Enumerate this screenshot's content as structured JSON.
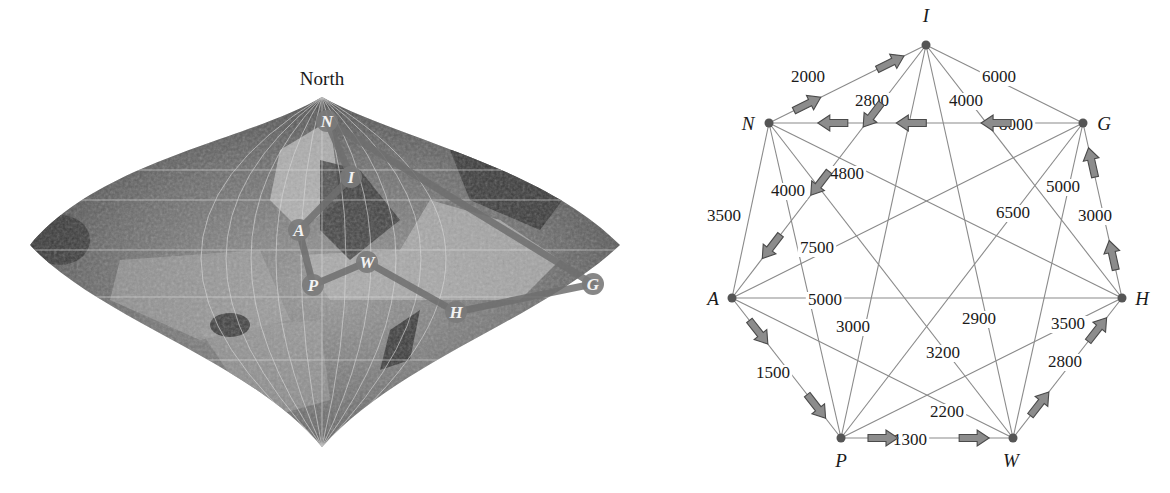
{
  "map": {
    "north_label": "North",
    "south_label": "South",
    "markers": [
      {
        "id": "N",
        "label": "N",
        "x": 327,
        "y": 121
      },
      {
        "id": "I",
        "label": "I",
        "x": 351,
        "y": 177
      },
      {
        "id": "A",
        "label": "A",
        "x": 299,
        "y": 230
      },
      {
        "id": "P",
        "label": "P",
        "x": 313,
        "y": 285
      },
      {
        "id": "W",
        "label": "W",
        "x": 367,
        "y": 262
      },
      {
        "id": "H",
        "label": "H",
        "x": 456,
        "y": 312
      },
      {
        "id": "G",
        "label": "G",
        "x": 593,
        "y": 284
      }
    ],
    "route": [
      "N",
      "I",
      "A",
      "P",
      "W",
      "H",
      "G",
      "N"
    ]
  },
  "graph": {
    "nodes": [
      {
        "id": "I",
        "label": "I",
        "x": 236,
        "y": 45,
        "lx": 236,
        "ly": 22
      },
      {
        "id": "N",
        "label": "N",
        "x": 79,
        "y": 123,
        "lx": 58,
        "ly": 130
      },
      {
        "id": "G",
        "label": "G",
        "x": 393,
        "y": 123,
        "lx": 414,
        "ly": 130
      },
      {
        "id": "A",
        "label": "A",
        "x": 42,
        "y": 298,
        "lx": 23,
        "ly": 305
      },
      {
        "id": "H",
        "label": "H",
        "x": 432,
        "y": 298,
        "lx": 452,
        "ly": 305
      },
      {
        "id": "P",
        "label": "P",
        "x": 151,
        "y": 438,
        "lx": 151,
        "ly": 467
      },
      {
        "id": "W",
        "label": "W",
        "x": 323,
        "y": 438,
        "lx": 321,
        "ly": 467
      }
    ],
    "edges": [
      {
        "from": "I",
        "to": "N",
        "weight": "2000",
        "lx": 118,
        "ly": 82
      },
      {
        "from": "I",
        "to": "A",
        "weight": "2800",
        "lx": 182,
        "ly": 106
      },
      {
        "from": "I",
        "to": "G",
        "weight": "6000",
        "lx": 309,
        "ly": 82
      },
      {
        "from": "I",
        "to": "H",
        "weight": "4000",
        "lx": 276,
        "ly": 106
      },
      {
        "from": "I",
        "to": "P",
        "weight": "3000",
        "lx": 163,
        "ly": 332
      },
      {
        "from": "I",
        "to": "W",
        "weight": "2900",
        "lx": 289,
        "ly": 324
      },
      {
        "from": "N",
        "to": "G",
        "weight": "8000",
        "lx": 326,
        "ly": 130
      },
      {
        "from": "N",
        "to": "A",
        "weight": "3500",
        "lx": 34,
        "ly": 221
      },
      {
        "from": "N",
        "to": "P",
        "weight": "4000",
        "lx": 98,
        "ly": 196
      },
      {
        "from": "N",
        "to": "H",
        "weight": "4800",
        "lx": 157,
        "ly": 179
      },
      {
        "from": "N",
        "to": "W",
        "weight": "3200",
        "lx": 253,
        "ly": 358
      },
      {
        "from": "G",
        "to": "A",
        "weight": "7500",
        "lx": 127,
        "ly": 253
      },
      {
        "from": "G",
        "to": "H",
        "weight": "3000",
        "lx": 405,
        "ly": 221
      },
      {
        "from": "G",
        "to": "P",
        "weight": "6500",
        "lx": 323,
        "ly": 218
      },
      {
        "from": "G",
        "to": "W",
        "weight": "5000",
        "lx": 373,
        "ly": 192
      },
      {
        "from": "A",
        "to": "H",
        "weight": "5000",
        "lx": 135,
        "ly": 305
      },
      {
        "from": "A",
        "to": "P",
        "weight": "1500",
        "lx": 83,
        "ly": 378
      },
      {
        "from": "A",
        "to": "W",
        "weight": "2200",
        "lx": 257,
        "ly": 417
      },
      {
        "from": "H",
        "to": "P",
        "weight": "3500",
        "lx": 378,
        "ly": 329
      },
      {
        "from": "H",
        "to": "W",
        "weight": "2800",
        "lx": 375,
        "ly": 367
      },
      {
        "from": "P",
        "to": "W",
        "weight": "1300",
        "lx": 220,
        "ly": 445
      }
    ],
    "tour": [
      {
        "from": "N",
        "to": "I"
      },
      {
        "from": "I",
        "to": "A"
      },
      {
        "from": "A",
        "to": "P"
      },
      {
        "from": "P",
        "to": "W"
      },
      {
        "from": "W",
        "to": "H"
      },
      {
        "from": "H",
        "to": "G"
      },
      {
        "from": "G",
        "to": "N"
      }
    ]
  },
  "colors": {
    "edge": "#8a8a8a",
    "node": "#555555",
    "arrow_fill": "#8c8c8c",
    "arrow_stroke": "#4a4a4a",
    "marker": "#7a7a7a",
    "map_dark": "#3a3a3a",
    "map_light": "#b5b5b5"
  }
}
